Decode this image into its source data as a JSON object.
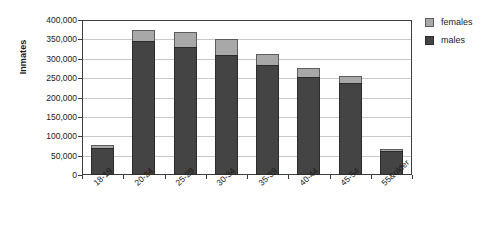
{
  "chart_data": {
    "type": "bar",
    "stacked": true,
    "title": "",
    "xlabel": "",
    "ylabel": "Inmates",
    "ylim": [
      0,
      400000
    ],
    "ytick_step": 50000,
    "grid": true,
    "legend_position": "right",
    "categories": [
      "18-19",
      "20-24",
      "25-29",
      "30-34",
      "35-39",
      "40-44",
      "45-54",
      "55&older"
    ],
    "ytick_labels": [
      "400,000",
      "350,000",
      "300,000",
      "250,000",
      "200,000",
      "150,000",
      "100,000",
      "50,000",
      "0"
    ],
    "ytick_values": [
      400000,
      350000,
      300000,
      250000,
      200000,
      150000,
      100000,
      50000,
      0
    ],
    "series": [
      {
        "name": "males",
        "color": "#444444",
        "values": [
          70000,
          347000,
          331000,
          311000,
          285000,
          253000,
          237000,
          61000
        ]
      },
      {
        "name": "females",
        "color": "#a8a8a8",
        "values": [
          8000,
          28000,
          37000,
          40000,
          28000,
          22000,
          18000,
          5000
        ]
      }
    ],
    "totals": [
      78000,
      375000,
      368000,
      351000,
      313000,
      275000,
      255000,
      66000
    ]
  },
  "legend": {
    "items": [
      {
        "label": "females",
        "color": "#a8a8a8"
      },
      {
        "label": "males",
        "color": "#444444"
      }
    ]
  },
  "axes": {
    "y_title": "Inmates"
  }
}
